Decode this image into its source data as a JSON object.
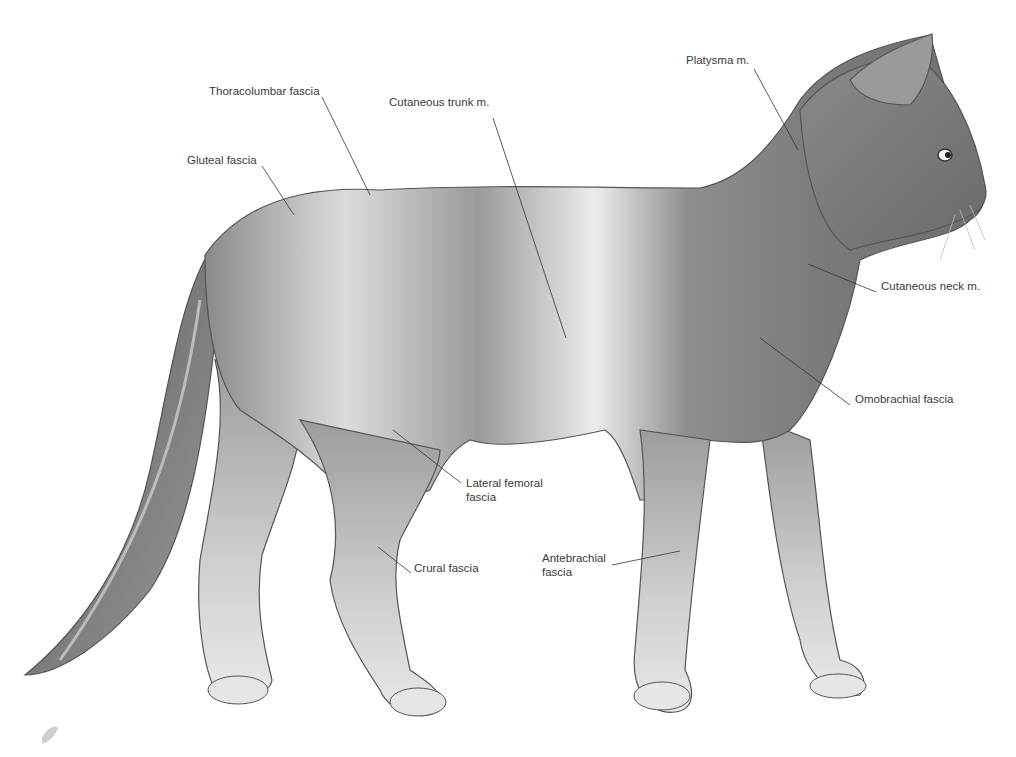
{
  "figure": {
    "colors": {
      "background": "#ffffff",
      "label_text": "#3a3a3a",
      "leader_line": "#333333",
      "body_light": "#e2e2e2",
      "body_mid": "#9a9a9a",
      "body_dark": "#5e5e5e"
    }
  },
  "labels": [
    {
      "id": "thoracolumbar-fascia",
      "text": "Thoracolumbar fascia",
      "x": 209,
      "y": 91
    },
    {
      "id": "cutaneous-trunk-m",
      "text": "Cutaneous trunk m.",
      "x": 389,
      "y": 102
    },
    {
      "id": "gluteal-fascia",
      "text": "Gluteal fascia",
      "x": 187,
      "y": 160
    },
    {
      "id": "platysma-m",
      "text": "Platysma m.",
      "x": 686,
      "y": 60
    },
    {
      "id": "cutaneous-neck-m",
      "text": "Cutaneous neck m.",
      "x": 881,
      "y": 286
    },
    {
      "id": "omobrachial-fascia",
      "text": "Omobrachial fascia",
      "x": 855,
      "y": 399
    },
    {
      "id": "lateral-femoral-fascia",
      "text": "Lateral femoral\nfascia",
      "line1": "Lateral femoral",
      "line2": "fascia",
      "x": 466,
      "y": 483
    },
    {
      "id": "crural-fascia",
      "text": "Crural fascia",
      "x": 414,
      "y": 568
    },
    {
      "id": "antebrachial-fascia",
      "text": "Antebrachial\nfascia",
      "line1": "Antebrachial",
      "line2": "fascia",
      "x": 542,
      "y": 558
    }
  ],
  "leader_lines": [
    {
      "label": "thoracolumbar-fascia",
      "x1": 322,
      "y1": 97,
      "x2": 370,
      "y2": 195
    },
    {
      "label": "cutaneous-trunk-m",
      "x1": 493,
      "y1": 118,
      "x2": 566,
      "y2": 338
    },
    {
      "label": "gluteal-fascia",
      "x1": 262,
      "y1": 166,
      "x2": 294,
      "y2": 215
    },
    {
      "label": "platysma-m",
      "x1": 754,
      "y1": 69,
      "x2": 798,
      "y2": 150
    },
    {
      "label": "cutaneous-neck-m",
      "x1": 876,
      "y1": 292,
      "x2": 808,
      "y2": 264
    },
    {
      "label": "omobrachial-fascia",
      "x1": 850,
      "y1": 405,
      "x2": 760,
      "y2": 338
    },
    {
      "label": "lateral-femoral-fascia",
      "x1": 461,
      "y1": 483,
      "x2": 393,
      "y2": 430
    },
    {
      "label": "crural-fascia",
      "x1": 411,
      "y1": 573,
      "x2": 378,
      "y2": 547
    },
    {
      "label": "antebrachial-fascia",
      "x1": 612,
      "y1": 565,
      "x2": 680,
      "y2": 551
    }
  ]
}
